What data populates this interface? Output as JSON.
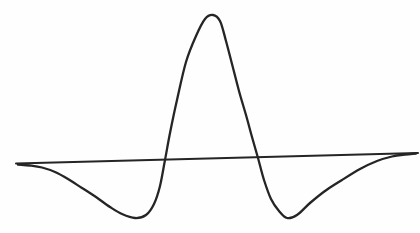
{
  "figure": {
    "kind": "hand-drawn function plot",
    "background_color": "#fefefe",
    "line_color": "#252525",
    "curve_stroke_width": 2.3,
    "baseline_stroke_width": 2.0
  },
  "chart_data": {
    "type": "line",
    "title": "",
    "xlabel": "",
    "ylabel": "",
    "axes_labeled": false,
    "grid": false,
    "legend": false,
    "baseline_px": {
      "x1": 16,
      "y1": 163.5,
      "x2": 418,
      "y2": 153.0
    },
    "curve_points_px": [
      [
        18,
        164.5
      ],
      [
        30,
        165.5
      ],
      [
        42,
        167.5
      ],
      [
        55,
        172
      ],
      [
        68,
        179
      ],
      [
        82,
        188
      ],
      [
        96,
        197
      ],
      [
        110,
        207
      ],
      [
        122,
        214
      ],
      [
        135,
        218
      ],
      [
        146,
        215
      ],
      [
        154,
        204
      ],
      [
        160,
        186
      ],
      [
        165,
        160
      ],
      [
        170,
        133
      ],
      [
        177,
        100
      ],
      [
        186,
        62
      ],
      [
        196,
        36
      ],
      [
        205,
        19
      ],
      [
        213,
        15
      ],
      [
        220,
        21
      ],
      [
        226,
        41
      ],
      [
        232,
        64
      ],
      [
        239,
        91
      ],
      [
        246,
        115
      ],
      [
        252,
        137
      ],
      [
        258,
        158
      ],
      [
        264,
        180
      ],
      [
        271,
        199
      ],
      [
        279,
        211
      ],
      [
        287,
        218
      ],
      [
        297,
        215
      ],
      [
        310,
        203
      ],
      [
        325,
        191
      ],
      [
        342,
        180
      ],
      [
        360,
        169
      ],
      [
        377,
        161
      ],
      [
        392,
        156.5
      ],
      [
        405,
        154.5
      ],
      [
        416,
        153.5
      ]
    ],
    "normalized_reading": {
      "peak_value_rel": 1.0,
      "side_lobe_min_rel": -0.39,
      "peak_x_px": 213,
      "zero_crossings_x_px": [
        165,
        258
      ],
      "trough_x_px": [
        135,
        287
      ]
    }
  }
}
